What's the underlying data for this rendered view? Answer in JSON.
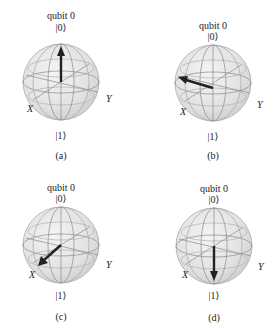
{
  "figure": {
    "panels": [
      {
        "id": "a",
        "title": "qubit 0",
        "north_label": "|0⟩",
        "south_label": "|1⟩",
        "x_label": "X",
        "y_label": "Y",
        "caption": "(a)",
        "state_vector": "+Z (points to |0⟩)"
      },
      {
        "id": "b",
        "title": "qubit 0",
        "north_label": "|0⟩",
        "south_label": "|1⟩",
        "x_label": "X",
        "y_label": "Y",
        "caption": "(b)",
        "state_vector": "-Y (points left in equatorial plane)"
      },
      {
        "id": "c",
        "title": "qubit 0",
        "north_label": "|0⟩",
        "south_label": "|1⟩",
        "x_label": "X",
        "y_label": "Y",
        "caption": "(c)",
        "state_vector": "+X (points toward X label)"
      },
      {
        "id": "d",
        "title": "qubit 0",
        "north_label": "|0⟩",
        "south_label": "|1⟩",
        "x_label": "X",
        "y_label": "Y",
        "caption": "(d)",
        "state_vector": "-Z (points to |1⟩)"
      }
    ],
    "colors": {
      "sphere_fill": "#e6e6e6",
      "wireframe": "#8a8a8a",
      "arrow": "#222222"
    }
  }
}
